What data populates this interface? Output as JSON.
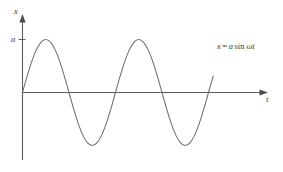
{
  "figure": {
    "background_color": "#ffffff",
    "curve_color": "#6d6d6d",
    "axis_color": "#5f5f5f",
    "text_color": "#3b3b3b"
  },
  "axes": {
    "y_axis_label": "x",
    "x_axis_label": "t",
    "amplitude_tick_label": "a"
  },
  "annotation": {
    "variable": "x",
    "equals": "=",
    "amplitude": "a",
    "function": "sin",
    "angular_frequency": "ω",
    "time": "t",
    "full_text": "x = a sin ωt"
  },
  "chart_data": {
    "type": "line",
    "title": "",
    "subtitle": "",
    "xlabel": "t",
    "ylabel": "x",
    "equation": "x = a sin ωt",
    "grid": false,
    "legend": null,
    "axis_style": "arrow-headed axes, origin at left",
    "amplitude": 1,
    "amplitude_label": "a",
    "cycles_shown": 2.05,
    "xlim": [
      0,
      2.05
    ],
    "ylim": [
      -1.25,
      1.25
    ],
    "yticks": [
      1
    ],
    "ytick_labels": [
      "a"
    ],
    "xticks": [],
    "xtick_labels": [],
    "series": [
      {
        "name": "x = a sin ωt",
        "color": "#6d6d6d",
        "x": [
          0.0,
          0.05,
          0.1,
          0.15,
          0.2,
          0.25,
          0.3,
          0.35,
          0.4,
          0.45,
          0.5,
          0.55,
          0.6,
          0.65,
          0.7,
          0.75,
          0.8,
          0.85,
          0.9,
          0.95,
          1.0,
          1.05,
          1.1,
          1.15,
          1.2,
          1.25,
          1.3,
          1.35,
          1.4,
          1.45,
          1.5,
          1.55,
          1.6,
          1.65,
          1.7,
          1.75,
          1.8,
          1.85,
          1.9,
          1.95,
          2.0,
          2.05
        ],
        "y": [
          0.0,
          0.309,
          0.588,
          0.809,
          0.951,
          1.0,
          0.951,
          0.809,
          0.588,
          0.309,
          0.0,
          -0.309,
          -0.588,
          -0.809,
          -0.951,
          -1.0,
          -0.951,
          -0.809,
          -0.588,
          -0.309,
          0.0,
          0.309,
          0.588,
          0.809,
          0.951,
          1.0,
          0.951,
          0.809,
          0.588,
          0.309,
          0.0,
          -0.309,
          -0.588,
          -0.809,
          -0.951,
          -1.0,
          -0.951,
          -0.809,
          -0.588,
          -0.309,
          0.0,
          0.309
        ]
      }
    ],
    "key_points": {
      "peaks": [
        0.25,
        1.25
      ],
      "troughs": [
        0.75,
        1.75
      ],
      "zero_crossings": [
        0.0,
        0.5,
        1.0,
        1.5,
        2.0
      ]
    }
  }
}
